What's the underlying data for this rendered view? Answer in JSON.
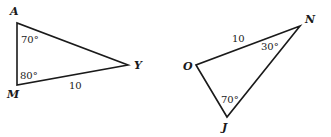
{
  "figure": {
    "triangles": [
      {
        "name": "AMY",
        "vertices": {
          "A": {
            "label": "A",
            "x": 17,
            "y": 23
          },
          "M": {
            "label": "M",
            "x": 17,
            "y": 85
          },
          "Y": {
            "label": "Y",
            "x": 128,
            "y": 65
          }
        },
        "angles": {
          "A": "70°",
          "M": "80°"
        },
        "sides": {
          "MY": "10"
        }
      },
      {
        "name": "OJN",
        "vertices": {
          "O": {
            "label": "O",
            "x": 196,
            "y": 65
          },
          "J": {
            "label": "J",
            "x": 227,
            "y": 117
          },
          "N": {
            "label": "N",
            "x": 300,
            "y": 26
          }
        },
        "angles": {
          "N": "30°",
          "J": "70°"
        },
        "sides": {
          "ON": "10"
        }
      }
    ]
  }
}
